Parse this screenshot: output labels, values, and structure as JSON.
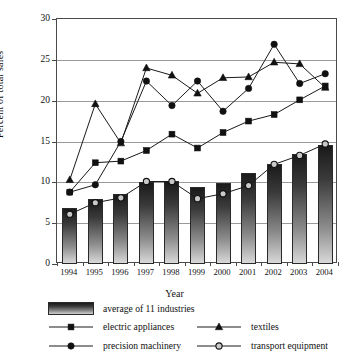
{
  "chart_data": {
    "type": "bar",
    "title": "",
    "xlabel": "Year",
    "ylabel": "Percent of total sales",
    "categories": [
      "1994",
      "1995",
      "1996",
      "1997",
      "1998",
      "1999",
      "2000",
      "2001",
      "2002",
      "2003",
      "2004"
    ],
    "ylim": [
      0,
      30
    ],
    "yticks": [
      0,
      5,
      10,
      15,
      20,
      25,
      30
    ],
    "grid": "horizontal",
    "legend_position": "below-axis",
    "series": [
      {
        "name": "average of 11 industries",
        "mark": "bar",
        "values": [
          6.9,
          7.9,
          8.6,
          10.1,
          10.2,
          9.4,
          9.9,
          11.1,
          12.3,
          13.5,
          14.6
        ]
      },
      {
        "name": "electric appliances",
        "mark": "filled-square",
        "values": [
          8.8,
          12.4,
          12.6,
          13.9,
          15.9,
          14.2,
          16.1,
          17.5,
          18.3,
          20.1,
          21.8
        ]
      },
      {
        "name": "textiles",
        "mark": "filled-triangle",
        "values": [
          10.3,
          19.6,
          14.8,
          24.0,
          23.1,
          20.9,
          22.8,
          22.9,
          24.7,
          24.5,
          21.6
        ]
      },
      {
        "name": "precision machinery",
        "mark": "filled-circle",
        "values": [
          8.8,
          9.7,
          15.0,
          22.4,
          19.4,
          22.4,
          18.7,
          21.5,
          26.9,
          22.1,
          23.3
        ]
      },
      {
        "name": "transport equipment",
        "mark": "open-circle",
        "values": [
          6.1,
          7.5,
          8.1,
          10.1,
          10.1,
          8.0,
          8.6,
          9.6,
          12.2,
          13.3,
          14.7
        ]
      }
    ]
  },
  "legend": {
    "entries": [
      {
        "label": "average of 11 industries",
        "mark": "bar"
      },
      {
        "label": "electric appliances",
        "mark": "filled-square"
      },
      {
        "label": "textiles",
        "mark": "filled-triangle"
      },
      {
        "label": "precision machinery",
        "mark": "filled-circle"
      },
      {
        "label": "transport equipment",
        "mark": "open-circle"
      }
    ]
  },
  "colors": {
    "axis": "#4a4a4a",
    "gridline": "#9a9a9a",
    "marker": "#111111",
    "bar_top": "#1a1a1a",
    "bar_bottom": "#d8d8d8",
    "open_marker_fill": "#c9c9c9",
    "background": "#ffffff"
  }
}
